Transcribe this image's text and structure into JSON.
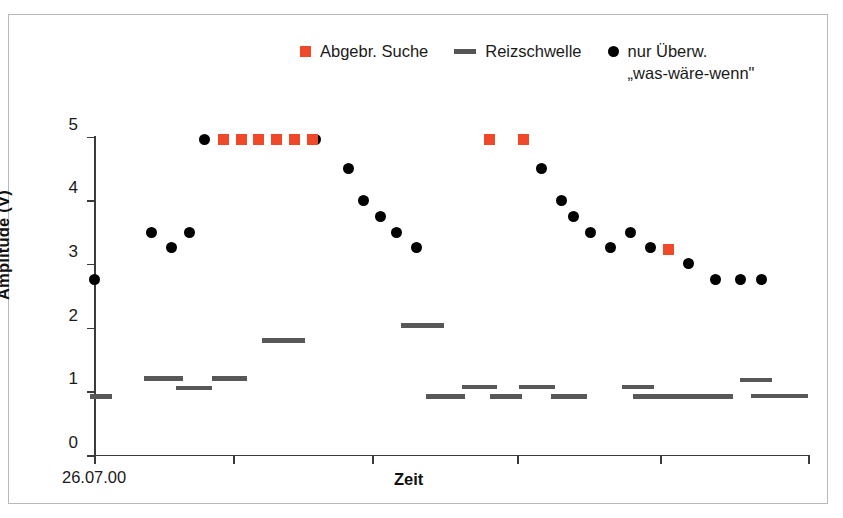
{
  "legend": {
    "items": [
      {
        "marker": "square",
        "color": "#F0492A",
        "label": "Abgebr. Suche"
      },
      {
        "marker": "line",
        "color": "#555555",
        "label": "Reizschwelle"
      },
      {
        "marker": "dot",
        "color": "#000000",
        "label": "nur Überw.\n„was-wäre-wenn\""
      }
    ],
    "item0_label": "Abgebr. Suche",
    "item1_label": "Reizschwelle",
    "item2_label_line1": "nur Überw.",
    "item2_label_line2": "„was-wäre-wenn\""
  },
  "axes": {
    "y_title": "Amplitude (V)",
    "x_title": "Zeit",
    "x_start_label": "26.07.00",
    "y_ticks": [
      "0",
      "1",
      "2",
      "3",
      "4",
      "5"
    ],
    "y_tick_0": "0",
    "y_tick_1": "1",
    "y_tick_2": "2",
    "y_tick_3": "3",
    "y_tick_4": "4",
    "y_tick_5": "5"
  },
  "chart_data": {
    "type": "scatter",
    "title": "",
    "xlabel": "Zeit",
    "ylabel": "Amplitude (V)",
    "xlim": [
      0,
      100
    ],
    "ylim": [
      0,
      5
    ],
    "x_axis_type": "time",
    "x_start": "26.07.00",
    "x_tick_positions_px": [
      94,
      233,
      372,
      517,
      660,
      808
    ],
    "grid": false,
    "legend_position": "top-center",
    "series": [
      {
        "name": "nur Überw. „was-wäre-wenn\"",
        "marker": "dot",
        "color": "#000000",
        "points": [
          {
            "x": 0.0,
            "y": 2.75
          },
          {
            "x": 8.1,
            "y": 3.5
          },
          {
            "x": 10.9,
            "y": 3.25
          },
          {
            "x": 13.4,
            "y": 3.5
          },
          {
            "x": 15.5,
            "y": 4.95
          },
          {
            "x": 31.0,
            "y": 4.95
          },
          {
            "x": 35.6,
            "y": 4.5
          },
          {
            "x": 37.8,
            "y": 4.0
          },
          {
            "x": 40.1,
            "y": 3.75
          },
          {
            "x": 42.3,
            "y": 3.5
          },
          {
            "x": 45.1,
            "y": 3.25
          },
          {
            "x": 62.7,
            "y": 4.5
          },
          {
            "x": 65.5,
            "y": 4.0
          },
          {
            "x": 67.2,
            "y": 3.75
          },
          {
            "x": 69.5,
            "y": 3.5
          },
          {
            "x": 72.3,
            "y": 3.25
          },
          {
            "x": 75.1,
            "y": 3.5
          },
          {
            "x": 78.0,
            "y": 3.25
          },
          {
            "x": 83.2,
            "y": 3.0
          },
          {
            "x": 87.0,
            "y": 2.75
          },
          {
            "x": 90.5,
            "y": 2.75
          },
          {
            "x": 93.5,
            "y": 2.75
          }
        ]
      },
      {
        "name": "Abgebr. Suche",
        "marker": "square",
        "color": "#F0492A",
        "points": [
          {
            "x": 18.1,
            "y": 4.95
          },
          {
            "x": 20.6,
            "y": 4.95
          },
          {
            "x": 23.1,
            "y": 4.95
          },
          {
            "x": 25.6,
            "y": 4.95
          },
          {
            "x": 28.1,
            "y": 4.95
          },
          {
            "x": 30.6,
            "y": 4.95
          },
          {
            "x": 55.4,
            "y": 4.95
          },
          {
            "x": 60.1,
            "y": 4.95
          },
          {
            "x": 80.5,
            "y": 3.23
          }
        ]
      },
      {
        "name": "Reizschwelle",
        "marker": "dash",
        "color": "#585858",
        "segments": [
          {
            "x_start": -0.5,
            "x_end": 2.5,
            "y": 0.92
          },
          {
            "x_start": 7.0,
            "x_end": 12.5,
            "y": 1.2
          },
          {
            "x_start": 11.5,
            "x_end": 16.5,
            "y": 1.05
          },
          {
            "x_start": 16.5,
            "x_end": 21.5,
            "y": 1.2
          },
          {
            "x_start": 23.5,
            "x_end": 29.5,
            "y": 1.8
          },
          {
            "x_start": 43.0,
            "x_end": 49.0,
            "y": 2.03
          },
          {
            "x_start": 46.5,
            "x_end": 52.0,
            "y": 0.92
          },
          {
            "x_start": 51.5,
            "x_end": 56.5,
            "y": 1.07
          },
          {
            "x_start": 55.5,
            "x_end": 60.0,
            "y": 0.92
          },
          {
            "x_start": 59.5,
            "x_end": 64.5,
            "y": 1.07
          },
          {
            "x_start": 64.0,
            "x_end": 69.0,
            "y": 0.92
          },
          {
            "x_start": 74.0,
            "x_end": 78.5,
            "y": 1.07
          },
          {
            "x_start": 75.5,
            "x_end": 87.5,
            "y": 0.92
          },
          {
            "x_start": 86.0,
            "x_end": 89.5,
            "y": 0.92
          },
          {
            "x_start": 90.5,
            "x_end": 95.0,
            "y": 1.18
          },
          {
            "x_start": 92.0,
            "x_end": 100.0,
            "y": 0.93
          }
        ]
      }
    ]
  }
}
